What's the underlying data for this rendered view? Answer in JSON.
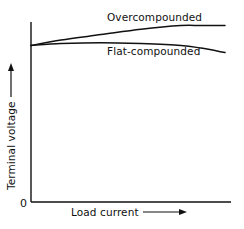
{
  "chart_data": {
    "type": "line",
    "title": "",
    "xlabel": "Load current",
    "ylabel": "Terminal voltage",
    "origin_label": "0",
    "x_ticks": [],
    "y_ticks": [],
    "grid": false,
    "legend_position": "inline-annotations",
    "x": [
      0.0,
      0.15,
      0.35,
      0.55,
      0.75,
      0.85,
      0.97
    ],
    "series": [
      {
        "name": "Overcompounded",
        "values": [
          0.87,
          0.9,
          0.93,
          0.96,
          0.98,
          0.98,
          0.98
        ]
      },
      {
        "name": "Flat-compounded",
        "values": [
          0.87,
          0.88,
          0.885,
          0.88,
          0.87,
          0.855,
          0.83
        ]
      }
    ],
    "xlim": [
      0,
      1
    ],
    "ylim": [
      0,
      1
    ],
    "annotations": [
      {
        "text": "Overcompounded",
        "position": "above upper curve"
      },
      {
        "text": "Flat-compounded",
        "position": "below lower curve"
      }
    ]
  },
  "colors": {
    "ink": "#111111",
    "background": "#ffffff"
  },
  "plot_box": {
    "origin_x": 31,
    "origin_y": 202,
    "x_axis_end": 231,
    "y_axis_top": 22,
    "width_px": 200,
    "height_px": 180
  }
}
